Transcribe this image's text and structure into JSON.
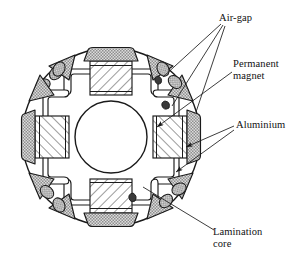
{
  "figure": {
    "type": "cross-section-diagram",
    "poles": 4,
    "background_color": "#ffffff",
    "line_color": "#1a1a1a",
    "hatch_color": "#5a5a5a",
    "stipple_color": "#9a9a9a"
  },
  "labels": {
    "air_gap": "Air-gap",
    "permanent_magnet_line1": "Permanent",
    "permanent_magnet_line2": "magnet",
    "aluminium": "Aluminium",
    "lamination_line1": "Lamination",
    "lamination_line2": "core"
  },
  "geometry": {
    "outer_circle": {
      "cx": 111,
      "cy": 137,
      "r": 89
    },
    "shaft_circle": {
      "cx": 111,
      "cy": 137,
      "r": 36
    },
    "magnet_count": 4,
    "aluminium_cap_count": 4,
    "wedge_count": 8,
    "oval_hole_count": 8
  },
  "parts": [
    {
      "name": "lamination-core",
      "fill": "white",
      "description": "Outer laminated steel disc"
    },
    {
      "name": "permanent-magnet",
      "fill": "diagonal-hatch",
      "description": "Four radially arranged hatched magnet blocks"
    },
    {
      "name": "aluminium",
      "fill": "stipple",
      "description": "Stippled caps at magnet outer faces and triangular wedges"
    },
    {
      "name": "air-gap",
      "fill": "white",
      "description": "Narrow curved flux-barrier slots and small oval voids"
    },
    {
      "name": "shaft-hole",
      "fill": "white",
      "description": "Central bore"
    }
  ]
}
